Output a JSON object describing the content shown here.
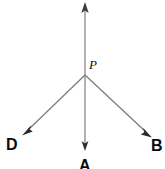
{
  "figure": {
    "type": "geometry-ray-diagram",
    "width": 165,
    "height": 169,
    "background_color": "#ffffff",
    "line_color": "#777777",
    "arrowhead_color": "#333333",
    "vertex": {
      "name": "P",
      "label": "P",
      "x": 85,
      "y": 75
    },
    "rays": [
      {
        "id": "ray-up",
        "label": "",
        "from_x": 85,
        "from_y": 75,
        "to_x": 85,
        "to_y": 3,
        "has_arrowhead": true
      },
      {
        "id": "ray-down-A",
        "label": "A",
        "from_x": 85,
        "from_y": 75,
        "to_x": 85,
        "to_y": 150,
        "has_arrowhead": true
      },
      {
        "id": "ray-left-D",
        "label": "D",
        "from_x": 85,
        "from_y": 75,
        "to_x": 22,
        "to_y": 135,
        "has_arrowhead": true
      },
      {
        "id": "ray-right-B",
        "label": "B",
        "from_x": 85,
        "from_y": 75,
        "to_x": 152,
        "to_y": 137,
        "has_arrowhead": true
      }
    ],
    "labels": {
      "vertex": "P",
      "left": "D",
      "bottom": "A",
      "right": "B"
    }
  }
}
